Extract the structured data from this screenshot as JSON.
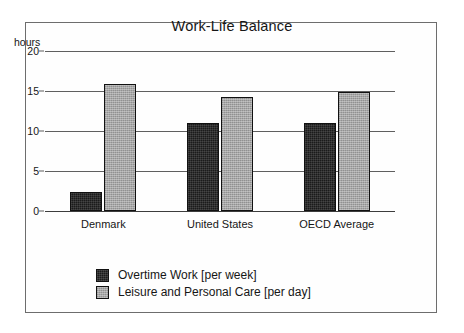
{
  "chart_data": {
    "type": "bar",
    "title": "Work-Life Balance",
    "xlabel": "",
    "ylabel": "hours",
    "ylim": [
      0,
      20
    ],
    "yticks": [
      0,
      5,
      10,
      15,
      20
    ],
    "ytick_labels": [
      "0",
      "5",
      "10",
      "15",
      "20"
    ],
    "grid": true,
    "grid_axis": "y",
    "legend_position": "bottom-left",
    "categories": [
      "Denmark",
      "United States",
      "OECD Average"
    ],
    "series": [
      {
        "name": "Overtime Work [per week]",
        "color": "#1b1b1b",
        "values": [
          2.4,
          11.0,
          11.0
        ]
      },
      {
        "name": "Leisure and Personal Care [per day]",
        "color": "#a6a6a6",
        "values": [
          15.9,
          14.3,
          14.9
        ]
      }
    ]
  },
  "legend": {
    "items": [
      {
        "label": "Overtime Work [per week]"
      },
      {
        "label": "Leisure and Personal Care [per day]"
      }
    ]
  }
}
